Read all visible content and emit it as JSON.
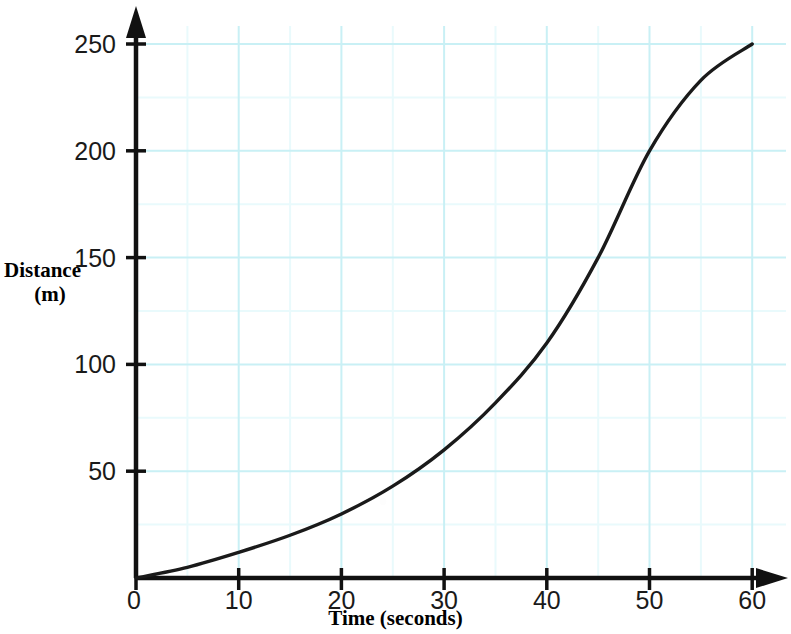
{
  "figure": {
    "background_color": "#ffffff",
    "axis_color": "#111111",
    "curve_color": "#1a1a1a",
    "grid_major_color": "#c9f0f5",
    "grid_minor_color": "#e9fafc"
  },
  "axes": {
    "y_title_line1": "Distance",
    "y_title_line2": "(m)",
    "x_title": "Time (seconds)",
    "y_ticks": [
      {
        "value": 0,
        "label": ""
      },
      {
        "value": 50,
        "label": "50"
      },
      {
        "value": 100,
        "label": "100"
      },
      {
        "value": 150,
        "label": "150"
      },
      {
        "value": 200,
        "label": "200"
      },
      {
        "value": 250,
        "label": "250"
      }
    ],
    "x_ticks": [
      {
        "value": 0,
        "label": "0"
      },
      {
        "value": 10,
        "label": "10"
      },
      {
        "value": 20,
        "label": "20"
      },
      {
        "value": 30,
        "label": "30"
      },
      {
        "value": 40,
        "label": "40"
      },
      {
        "value": 50,
        "label": "50"
      },
      {
        "value": 60,
        "label": "60"
      }
    ]
  },
  "chart_data": {
    "type": "line",
    "title": "",
    "xlabel": "Time (seconds)",
    "ylabel": "Distance (m)",
    "xlim": [
      0,
      60
    ],
    "ylim": [
      0,
      250
    ],
    "grid": true,
    "grid_major_step_x": 10,
    "grid_major_step_y": 50,
    "grid_minor_step_x": 5,
    "grid_minor_step_y": 25,
    "legend": null,
    "x": [
      0,
      5,
      10,
      15,
      20,
      25,
      30,
      35,
      40,
      45,
      50,
      55,
      60
    ],
    "series": [
      {
        "name": "Distance travelled",
        "values": [
          0,
          5,
          12,
          20,
          30,
          43,
          60,
          82,
          110,
          150,
          200,
          233,
          250
        ]
      }
    ]
  }
}
